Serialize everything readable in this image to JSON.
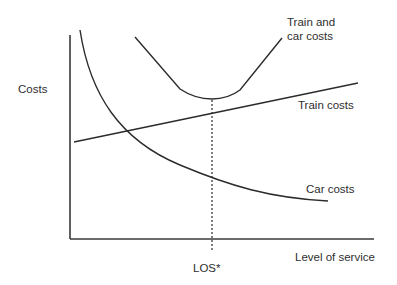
{
  "diagram": {
    "title": "",
    "y_axis_label": "Costs",
    "x_axis_label": "Level of service",
    "optimum_label": "LOS*",
    "curves": [
      {
        "name": "Train and car costs",
        "label_line1": "Train and",
        "label_line2": "car costs",
        "shape": "U-shaped total cost curve"
      },
      {
        "name": "Train costs",
        "label": "Train costs",
        "shape": "rising straight line"
      },
      {
        "name": "Car costs",
        "label": "Car costs",
        "shape": "falling convex curve"
      }
    ],
    "annotation": "Dashed vertical line marks LOS* at the minimum of the train and car costs curve"
  },
  "colors": {
    "line": "#2b2b2b",
    "text": "#2e2e2e",
    "background": "#ffffff"
  }
}
